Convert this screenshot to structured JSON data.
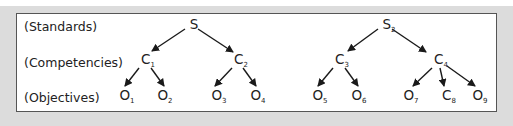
{
  "diagram": {
    "type": "hierarchy-tree",
    "row_labels": {
      "standards": "(Standards)",
      "competencies": "(Competencies)",
      "objectives": "(Objectives)"
    },
    "nodes": {
      "s1": {
        "base": "S",
        "sub": ""
      },
      "s2": {
        "base": "S",
        "sub": "2"
      },
      "c1": {
        "base": "C",
        "sub": "1"
      },
      "c2": {
        "base": "C",
        "sub": "2"
      },
      "c3": {
        "base": "C",
        "sub": "3"
      },
      "c4": {
        "base": "C",
        "sub": "4"
      },
      "o1": {
        "base": "O",
        "sub": "1"
      },
      "o2": {
        "base": "O",
        "sub": "2"
      },
      "o3": {
        "base": "O",
        "sub": "3"
      },
      "o4": {
        "base": "O",
        "sub": "4"
      },
      "o5": {
        "base": "O",
        "sub": "5"
      },
      "o6": {
        "base": "O",
        "sub": "6"
      },
      "o7": {
        "base": "O",
        "sub": "7"
      },
      "c8": {
        "base": "C",
        "sub": "8"
      },
      "o9": {
        "base": "O",
        "sub": "9"
      }
    },
    "edges": [
      [
        "s1",
        "c1"
      ],
      [
        "s1",
        "c2"
      ],
      [
        "s2",
        "c3"
      ],
      [
        "s2",
        "c4"
      ],
      [
        "c1",
        "o1"
      ],
      [
        "c1",
        "o2"
      ],
      [
        "c2",
        "o3"
      ],
      [
        "c2",
        "o4"
      ],
      [
        "c3",
        "o5"
      ],
      [
        "c3",
        "o6"
      ],
      [
        "c4",
        "o7"
      ],
      [
        "c4",
        "c8"
      ],
      [
        "c4",
        "o9"
      ]
    ],
    "colors": {
      "line": "#1a1a1a",
      "text": "#222222",
      "frame": "#555555",
      "background": "#dcdcdc"
    }
  }
}
